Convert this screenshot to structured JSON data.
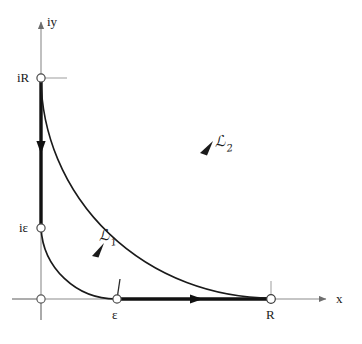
{
  "figure": {
    "axes": {
      "x_label": "x",
      "y_label": "iy",
      "origin": {
        "x": 41,
        "y": 299
      },
      "x_axis": {
        "start_x": 12,
        "end_x": 330,
        "y": 299,
        "arrow": true,
        "color": "#8c8c8c"
      },
      "y_axis": {
        "x": 41,
        "start_y": 320,
        "end_y": 18,
        "arrow": true,
        "color": "#8c8c8c"
      }
    },
    "points": [
      {
        "name": "origin",
        "label": "",
        "x": 41,
        "y": 299,
        "marker": "open-circle"
      },
      {
        "name": "epsilon",
        "label": "ε",
        "x": 117,
        "y": 299,
        "marker": "open-circle"
      },
      {
        "name": "R",
        "label": "R",
        "x": 271,
        "y": 299,
        "marker": "open-circle"
      },
      {
        "name": "i-epsilon",
        "label": "iε",
        "x": 41,
        "y": 228,
        "marker": "open-circle"
      },
      {
        "name": "i-R",
        "label": "iR",
        "x": 41,
        "y": 78,
        "marker": "open-circle"
      }
    ],
    "contours": [
      {
        "name": "small-arc",
        "label": "ℒ",
        "label_subscript": "1",
        "type": "arc",
        "radius": 75,
        "from": "epsilon",
        "to": "i-epsilon",
        "direction": "counterclockwise",
        "stroke": "#1a1a1a",
        "width": 1.6,
        "arrow_at": {
          "x": 96,
          "y": 251
        }
      },
      {
        "name": "large-arc",
        "label": "ℒ",
        "label_subscript": "2",
        "type": "arc",
        "radius": 230,
        "from": "R",
        "to": "i-R",
        "direction": "counterclockwise",
        "stroke": "#1a1a1a",
        "width": 1.6,
        "arrow_at": {
          "x": 206,
          "y": 149
        }
      },
      {
        "name": "real-axis-segment",
        "label": "",
        "type": "segment",
        "from": "epsilon",
        "to": "R",
        "direction": "rightward",
        "stroke": "#111111",
        "width": 3.4,
        "arrow_at": {
          "x": 198,
          "y": 299
        }
      },
      {
        "name": "imaginary-axis-segment",
        "label": "",
        "type": "segment",
        "from": "i-R",
        "to": "i-epsilon",
        "direction": "downward",
        "stroke": "#111111",
        "width": 3.4,
        "arrow_at": {
          "x": 41,
          "y": 148
        }
      }
    ],
    "ticks": [
      {
        "name": "tick-epsilon",
        "x": 117,
        "y": 299,
        "orientation": "up",
        "length": 20
      },
      {
        "name": "tick-R",
        "x": 271,
        "y": 299,
        "orientation": "up",
        "length": 18
      },
      {
        "name": "tick-origin-left",
        "x": 41,
        "y": 299,
        "orientation": "left",
        "length": 29
      },
      {
        "name": "tick-origin-down",
        "x": 41,
        "y": 299,
        "orientation": "down",
        "length": 21
      },
      {
        "name": "tick-iR",
        "x": 41,
        "y": 78,
        "orientation": "right",
        "length": 26
      }
    ],
    "colors": {
      "axis_gray": "#8c8c8c",
      "contour_black": "#111111",
      "tick_gray": "#9a9a9a",
      "marker_fill": "#ffffff",
      "text": "#1a1a1a",
      "background": "#ffffff"
    }
  }
}
